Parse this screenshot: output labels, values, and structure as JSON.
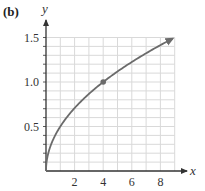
{
  "panel_label": "(b)",
  "chart_data": {
    "type": "line",
    "title": "",
    "function": "y = sqrt(x) / 2",
    "xlabel": "x",
    "ylabel": "y",
    "xlim": [
      0,
      9
    ],
    "ylim": [
      0,
      1.5
    ],
    "x_ticks": [
      2,
      4,
      6,
      8
    ],
    "x_tick_labels": [
      "2",
      "4",
      "6",
      "8"
    ],
    "y_ticks": [
      0.5,
      1.0,
      1.5
    ],
    "y_tick_labels": [
      "0.5",
      "1.0",
      "1.5"
    ],
    "grid": {
      "on": true,
      "x_step": 1,
      "y_step": 0.1
    },
    "series": [
      {
        "name": "curve",
        "x": [
          0,
          0.25,
          0.5,
          1,
          2,
          3,
          4,
          5,
          6,
          7,
          8,
          9
        ],
        "y": [
          0,
          0.25,
          0.354,
          0.5,
          0.707,
          0.866,
          1.0,
          1.118,
          1.225,
          1.323,
          1.414,
          1.5
        ],
        "color": "#6b6b6b",
        "end_arrow": true
      }
    ],
    "highlighted_point": {
      "x": 4,
      "y": 1.0,
      "color": "#6b6b6b"
    },
    "legend": null
  },
  "colors": {
    "axis": "#333333",
    "grid": "#d9d9d9",
    "curve": "#6b6b6b"
  }
}
